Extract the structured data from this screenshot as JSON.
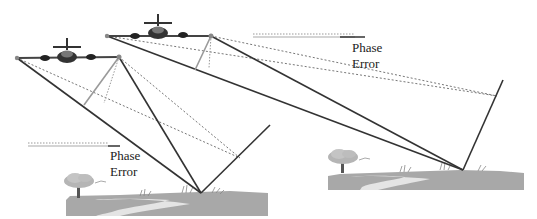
{
  "diagram": {
    "panels": [
      {
        "id": "left",
        "label_line1": "Phase",
        "label_line2": "Error",
        "antenna_a": [
          17,
          58
        ],
        "antenna_b": [
          119,
          57
        ],
        "ground_point": [
          201,
          193
        ],
        "far_end": [
          270,
          125
        ],
        "far_end_dotted": [
          240,
          158
        ]
      },
      {
        "id": "right",
        "label_line1": "Phase",
        "label_line2": "Error",
        "antenna_a": [
          107,
          36
        ],
        "antenna_b": [
          211,
          36
        ],
        "ground_point": [
          463,
          170
        ],
        "far_end": [
          503,
          80
        ],
        "far_end_dotted": [
          497,
          96
        ]
      }
    ],
    "colors": {
      "line_dark": "#333333",
      "line_gray": "#9a9a9a",
      "dotted": "#777777",
      "ground": "#a8a8a8",
      "water": "#e6e6e6"
    }
  }
}
